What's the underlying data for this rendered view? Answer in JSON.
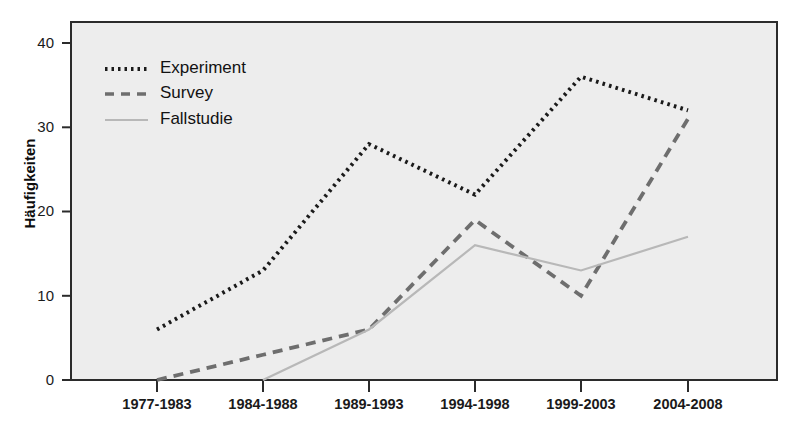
{
  "chart_data": {
    "type": "line",
    "title": "",
    "xlabel": "",
    "ylabel": "Häufigkeiten",
    "categories": [
      "1977-1983",
      "1984-1988",
      "1989-1993",
      "1994-1998",
      "1999-2003",
      "2004-2008"
    ],
    "ylim": [
      0,
      42
    ],
    "yticks": [
      0,
      10,
      20,
      30,
      40
    ],
    "ytick_labels": [
      "0",
      "10",
      "20",
      "30",
      "40"
    ],
    "grid": false,
    "legend_position": "upper-left",
    "series": [
      {
        "name": "Experiment",
        "values": [
          6,
          13,
          28,
          22,
          36,
          32
        ],
        "style": "dotted",
        "color": "#1a1a1a"
      },
      {
        "name": "Survey",
        "values": [
          0,
          3,
          6,
          19,
          10,
          31
        ],
        "style": "dashed",
        "color": "#6e6e6e"
      },
      {
        "name": "Fallstudie",
        "values": [
          null,
          0,
          6,
          16,
          13,
          17
        ],
        "style": "solid",
        "color": "#b8b8b8"
      }
    ]
  },
  "axis": {
    "ytick_0": "0",
    "ytick_1": "10",
    "ytick_2": "20",
    "ytick_3": "30",
    "ytick_4": "40",
    "ylabel": "Häufigkeiten",
    "xtick_0": "1977-1983",
    "xtick_1": "1984-1988",
    "xtick_2": "1989-1993",
    "xtick_3": "1994-1998",
    "xtick_4": "1999-2003",
    "xtick_5": "2004-2008"
  },
  "legend": {
    "entry_0": "Experiment",
    "entry_1": "Survey",
    "entry_2": "Fallstudie"
  },
  "colors": {
    "plot_background": "#eeeeee",
    "frame": "#2b2b2b",
    "experiment": "#1a1a1a",
    "survey": "#6e6e6e",
    "fallstudie": "#b8b8b8"
  }
}
